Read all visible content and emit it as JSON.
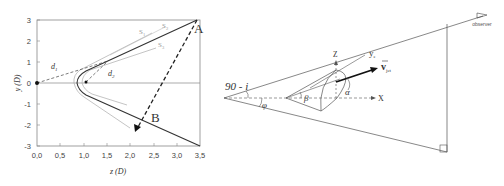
{
  "left_plot": {
    "type": "diagram-plot",
    "xlabel": "z  (D)",
    "ylabel": "y (D)",
    "x_ticks": [
      "0,0",
      "0,5",
      "1,0",
      "1,5",
      "2,0",
      "2,5",
      "3,0",
      "3,5"
    ],
    "y_ticks": [
      "3",
      "2",
      "1",
      "0",
      "-1",
      "-2",
      "-3"
    ],
    "xlim": [
      0,
      3.5
    ],
    "ylim": [
      -3,
      3
    ],
    "labels": {
      "A": "A",
      "B": "B",
      "S1": "S",
      "S1_sub": "1",
      "S2": "S",
      "S2_sub": "2",
      "S3": "S",
      "S3_sub": "3",
      "d1": "d",
      "d1_sub": "1",
      "d2": "d",
      "d2_sub": "2"
    }
  },
  "right_diagram": {
    "angle_label": "90 - i",
    "phi": "φ",
    "beta": "β",
    "alpha": "α",
    "axis_z": "Z",
    "axis_x": "X",
    "axis_y": "y",
    "axis_y_sub": "e",
    "velocity": "v",
    "velocity_sub": "jet",
    "observer": "observer"
  }
}
